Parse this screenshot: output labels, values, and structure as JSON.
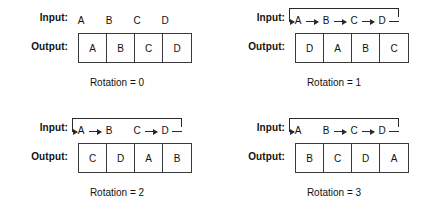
{
  "figure": {
    "labels": {
      "input": "Input:",
      "output": "Output:"
    },
    "panels": [
      {
        "id": "rotation-0",
        "caption": "Rotation = 0",
        "input_letters": [
          "A",
          "B",
          "C",
          "D"
        ],
        "output_letters": [
          "A",
          "B",
          "C",
          "D"
        ],
        "arrows": [],
        "wrap": false
      },
      {
        "id": "rotation-1",
        "caption": "Rotation = 1",
        "input_letters": [
          "A",
          "B",
          "C",
          "D"
        ],
        "output_letters": [
          "D",
          "A",
          "B",
          "C"
        ],
        "arrows": [
          0,
          1,
          2
        ],
        "wrap": true
      },
      {
        "id": "rotation-2",
        "caption": "Rotation = 2",
        "input_letters": [
          "A",
          "B",
          "C",
          "D"
        ],
        "output_letters": [
          "C",
          "D",
          "A",
          "B"
        ],
        "arrows": [
          0,
          2
        ],
        "wrap": true
      },
      {
        "id": "rotation-3",
        "caption": "Rotation = 3",
        "input_letters": [
          "A",
          "B",
          "C",
          "D"
        ],
        "output_letters": [
          "B",
          "C",
          "D",
          "A"
        ],
        "arrows": [
          1,
          2
        ],
        "wrap": true
      }
    ],
    "colors": {
      "line": "#2a2a2a",
      "box_border": "#3a3a3a",
      "text": "#111111",
      "background": "#ffffff"
    }
  }
}
